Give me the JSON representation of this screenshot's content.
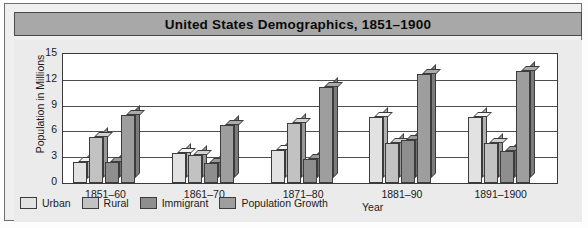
{
  "figure": {
    "title": "United States  Demographics, 1851–1900"
  },
  "axes": {
    "ylabel": "Population in Millions",
    "xlabel": "Year",
    "yticks": [
      "15",
      "12",
      "9",
      "6",
      "3",
      "0"
    ]
  },
  "legend": {
    "items": [
      {
        "label": "Urban",
        "color": "#e2e2e2"
      },
      {
        "label": "Rural",
        "color": "#c2c2c2"
      },
      {
        "label": "Immigrant",
        "color": "#8e8e8e"
      },
      {
        "label": "Population Growth",
        "color": "#9e9e9e"
      }
    ]
  },
  "chart_data": {
    "type": "bar",
    "title": "United States  Demographics, 1851–1900",
    "xlabel": "Year",
    "ylabel": "Population in Millions",
    "ylim": [
      0,
      15
    ],
    "ytick_values": [
      0,
      3,
      6,
      9,
      12,
      15
    ],
    "grid": true,
    "legend_position": "bottom-left",
    "categories": [
      "1851–60",
      "1861–70",
      "1871–80",
      "1881–90",
      "1891–1900"
    ],
    "series": [
      {
        "name": "Urban",
        "color": "#e2e2e2",
        "values": [
          2.5,
          3.5,
          3.8,
          7.7,
          7.7
        ]
      },
      {
        "name": "Rural",
        "color": "#c2c2c2",
        "values": [
          5.3,
          3.2,
          7.0,
          4.7,
          4.6
        ]
      },
      {
        "name": "Immigrant",
        "color": "#8e8e8e",
        "values": [
          2.4,
          2.3,
          2.8,
          5.0,
          3.7
        ]
      },
      {
        "name": "Population Growth",
        "color": "#9e9e9e",
        "values": [
          7.9,
          6.7,
          11.2,
          12.7,
          13.0
        ]
      }
    ]
  }
}
